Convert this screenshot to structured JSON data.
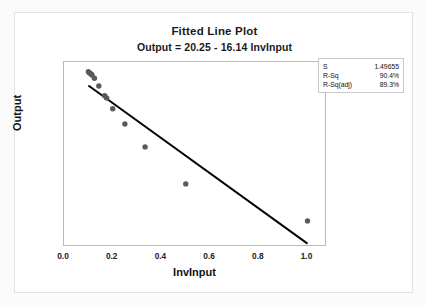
{
  "chart_data": {
    "type": "scatter",
    "title": "Fitted Line Plot",
    "subtitle": "Output = 20.25 - 16.14 InvInput",
    "xlabel": "InvInput",
    "ylabel": "Output",
    "xlim": [
      0.0,
      1.08
    ],
    "ylim": [
      3.8,
      20.8
    ],
    "xticks": [
      "0.0",
      "0.2",
      "0.4",
      "0.6",
      "0.8",
      "1.0"
    ],
    "xtick_values": [
      0.0,
      0.2,
      0.4,
      0.6,
      0.8,
      1.0
    ],
    "yticks": [
      "5.0",
      "7.5",
      "10.0",
      "12.5",
      "15.0",
      "17.5",
      "20.0"
    ],
    "ytick_values": [
      5.0,
      7.5,
      10.0,
      12.5,
      15.0,
      17.5,
      20.0
    ],
    "grid": false,
    "legend": "none",
    "marker_color": "#5a5a5a",
    "line_color": "#000000",
    "points": [
      {
        "x": 0.1,
        "y": 19.9
      },
      {
        "x": 0.105,
        "y": 19.8
      },
      {
        "x": 0.111,
        "y": 19.7
      },
      {
        "x": 0.115,
        "y": 19.6
      },
      {
        "x": 0.125,
        "y": 19.3
      },
      {
        "x": 0.143,
        "y": 18.6
      },
      {
        "x": 0.167,
        "y": 17.7
      },
      {
        "x": 0.175,
        "y": 17.5
      },
      {
        "x": 0.2,
        "y": 16.5
      },
      {
        "x": 0.25,
        "y": 15.1
      },
      {
        "x": 0.333,
        "y": 13.0
      },
      {
        "x": 0.5,
        "y": 9.6
      },
      {
        "x": 1.0,
        "y": 6.2
      }
    ],
    "fit_line": {
      "intercept": 20.25,
      "slope": -16.14,
      "x_start": 0.1,
      "x_end": 1.0,
      "label": "Output = 20.25 - 16.14 InvInput"
    },
    "stats": [
      {
        "key": "S",
        "value": "1.49655"
      },
      {
        "key": "R-Sq",
        "value": "90.4%"
      },
      {
        "key": "R-Sq(adj)",
        "value": "89.3%"
      }
    ]
  }
}
